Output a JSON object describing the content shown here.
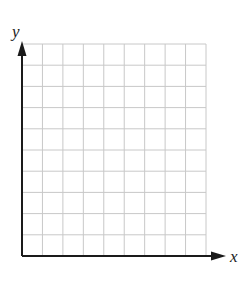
{
  "diagram": {
    "type": "blank coordinate grid",
    "axes": {
      "x_label": "x",
      "y_label": "y"
    },
    "grid": {
      "columns": 10,
      "rows": 10,
      "line_color": "#c8c8c8",
      "axis_color": "#1a1a1a"
    }
  }
}
